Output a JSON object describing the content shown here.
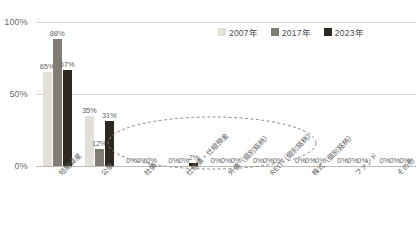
{
  "chart_data": {
    "type": "bar",
    "title": "",
    "subtitle": "",
    "xlabel": "",
    "ylabel": "",
    "ylim": [
      0,
      100
    ],
    "yticks": [
      "0%",
      "50%",
      "100%"
    ],
    "grid": true,
    "legend_position": "top-right",
    "categories": [
      "短期資産",
      "公債",
      "社債",
      "仕組債・仕組預金",
      "外債（個別銘柄）",
      "REIT（個別銘柄）",
      "株式（個別銘柄）",
      "ファンド",
      "その他"
    ],
    "series": [
      {
        "name": "2007年",
        "color": "#e2e0d9",
        "values": [
          65,
          35,
          0,
          0,
          0,
          0,
          0,
          0,
          0
        ],
        "labels": [
          "65%",
          "35%",
          "0%",
          "0%",
          "0%",
          "0%",
          "0%",
          "0%",
          "0%"
        ]
      },
      {
        "name": "2017年",
        "color": "#807d74",
        "values": [
          88,
          12,
          0,
          0,
          0,
          0,
          0,
          0,
          0
        ],
        "labels": [
          "88%",
          "12%",
          "0%",
          "0%",
          "0%",
          "0%",
          "0%",
          "0%",
          "0%"
        ]
      },
      {
        "name": "2023年",
        "color": "#2e2820",
        "values": [
          67,
          31,
          0,
          2,
          0,
          0,
          0,
          0,
          0
        ],
        "labels": [
          "67%",
          "31%",
          "0%",
          "2%",
          "0%",
          "0%",
          "0%",
          "0%",
          "0%"
        ]
      }
    ],
    "annotations": [
      {
        "type": "ellipse",
        "style": "dashed",
        "color": "#8a8a8a",
        "covers_categories": [
          "社債",
          "仕組債・仕組預金",
          "外債（個別銘柄）",
          "REIT（個別銘柄）",
          "株式（個別銘柄）"
        ]
      }
    ]
  },
  "legend": {
    "items": [
      {
        "label": "2007年",
        "color": "#e2e0d9"
      },
      {
        "label": "2017年",
        "color": "#807d74"
      },
      {
        "label": "2023年",
        "color": "#2e2820"
      }
    ]
  },
  "axis": {
    "y": {
      "tick_100": "100%",
      "tick_50": "50%",
      "tick_0": "0%"
    }
  }
}
